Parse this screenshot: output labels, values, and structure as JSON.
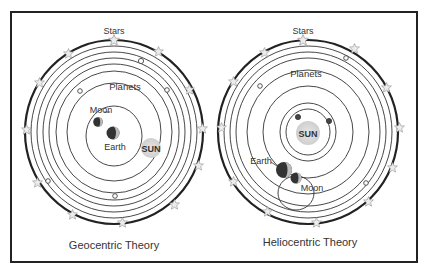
{
  "diagrams": [
    {
      "title": "Geocentric Theory",
      "labels": {
        "stars": "Stars",
        "planets": "Planets",
        "moon": "Moon",
        "earth": "Earth",
        "sun": "SUN"
      }
    },
    {
      "title": "Heliocentric Theory",
      "labels": {
        "stars": "Stars",
        "planets": "Planets",
        "moon": "Moon",
        "earth": "Earth",
        "sun": "SUN"
      }
    }
  ],
  "colors": {
    "frame": "#222222",
    "orbit": "#333333",
    "sun_fill": "#d9d9d9",
    "star_fill": "#e8e8e8"
  }
}
